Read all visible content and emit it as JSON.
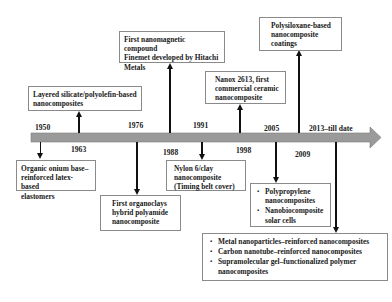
{
  "diagram": {
    "type": "timeline",
    "bar_color": "#9a9a9a",
    "bar_edge_color": "#7d7d7d",
    "line_color": "#111111",
    "years_above": [
      {
        "id": "y1950",
        "label": "1950"
      },
      {
        "id": "y1976",
        "label": "1976"
      },
      {
        "id": "y1991",
        "label": "1991"
      },
      {
        "id": "y2005",
        "label": "2005"
      },
      {
        "id": "y2013",
        "label": "2013–till date"
      }
    ],
    "years_below": [
      {
        "id": "y1963",
        "label": "1963"
      },
      {
        "id": "y1988",
        "label": "1988"
      },
      {
        "id": "y1998",
        "label": "1998"
      },
      {
        "id": "y2009",
        "label": "2009"
      }
    ],
    "events": {
      "e1950": {
        "year": "1950",
        "lines": [
          "Organic onium base–",
          "reinforced latex-based",
          "elastomers"
        ]
      },
      "e1963": {
        "year": "1963",
        "lines": [
          "Layered silicate/polyolefin-based",
          "nanocomposites"
        ]
      },
      "e1976": {
        "year": "1976",
        "lines": [
          "First organoclays",
          "hybrid polyamide",
          "nanocomposite"
        ]
      },
      "e1988": {
        "year": "1988",
        "lines": [
          "First nanomagnetic compound",
          "Finemet developed by Hitachi",
          "Metals"
        ]
      },
      "e1991": {
        "year": "1991",
        "lines": [
          "Nylon 6/clay",
          "nanocomposite",
          "(Timing belt cover)"
        ]
      },
      "e1998": {
        "year": "1998",
        "lines": [
          "Nanox 2613, first",
          "commercial ceramic",
          "nanocomposite"
        ]
      },
      "e2005": {
        "year": "2005",
        "items": [
          "Polypropylene nanocomposites",
          "Nanobiocomposite solar cells"
        ]
      },
      "e2009": {
        "year": "2009",
        "lines": [
          "Polysiloxane-based",
          "nanocomposite",
          "coatings"
        ]
      },
      "e2013": {
        "year": "2013–till date",
        "items": [
          "Metal nanoparticles–reinforced nanocomposites",
          "Carbon nanotube–reinforced nanocomposites",
          "Supramolecular gel–functionalized polymer nanocomposites"
        ]
      }
    }
  }
}
